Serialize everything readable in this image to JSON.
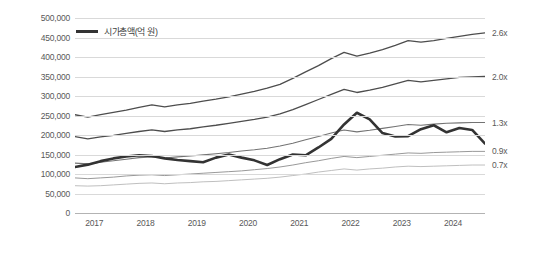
{
  "legend": {
    "label": "시가총액(억 원)",
    "swatch_color": "#333333"
  },
  "axes": {
    "y_ticks": [
      "500,000",
      "450,000",
      "400,000",
      "350,000",
      "300,000",
      "250,000",
      "200,000",
      "150,000",
      "100,000",
      "50,000",
      "0"
    ],
    "y_tick_values": [
      500000,
      450000,
      400000,
      350000,
      300000,
      250000,
      200000,
      150000,
      100000,
      50000,
      0
    ],
    "x_ticks": [
      "2017",
      "2018",
      "2019",
      "2020",
      "2021",
      "2022",
      "2023",
      "2024"
    ],
    "y_min": 0,
    "y_max": 500000,
    "grid": true
  },
  "band_labels": [
    {
      "text": "2.6x",
      "value": 462000
    },
    {
      "text": "2.0x",
      "value": 350000
    },
    {
      "text": "1.3x",
      "value": 232000
    },
    {
      "text": "0.9x",
      "value": 158000
    },
    {
      "text": "0.7x",
      "value": 123000
    }
  ],
  "chart_data": {
    "type": "line",
    "title": "",
    "subtitle": "",
    "xlabel": "",
    "ylabel": "",
    "ylim": [
      0,
      500000
    ],
    "xlim": [
      2016.75,
      2024.75
    ],
    "grid": true,
    "legend_position": "top-left",
    "x": [
      2016.75,
      2017.0,
      2017.25,
      2017.5,
      2017.75,
      2018.0,
      2018.25,
      2018.5,
      2018.75,
      2019.0,
      2019.25,
      2019.5,
      2019.75,
      2020.0,
      2020.25,
      2020.5,
      2020.75,
      2021.0,
      2021.25,
      2021.5,
      2021.75,
      2022.0,
      2022.25,
      2022.5,
      2022.75,
      2023.0,
      2023.25,
      2023.5,
      2023.75,
      2024.0,
      2024.25,
      2024.5,
      2024.75
    ],
    "annotations": [
      "2.6x",
      "2.0x",
      "1.3x",
      "0.9x",
      "0.7x"
    ],
    "series": [
      {
        "name": "시가총액(억 원)",
        "color": "#333333",
        "width": 2.6,
        "values": [
          118000,
          124000,
          133000,
          140000,
          145000,
          148000,
          146000,
          140000,
          136000,
          133000,
          130000,
          142000,
          150000,
          142000,
          135000,
          123000,
          138000,
          150000,
          148000,
          168000,
          190000,
          227000,
          257000,
          240000,
          205000,
          196000,
          197000,
          215000,
          225000,
          207000,
          218000,
          213000,
          178000
        ]
      },
      {
        "name": "2.6x",
        "color": "#4d4d4d",
        "width": 1.3,
        "values": [
          252000,
          246000,
          252000,
          258000,
          264000,
          271000,
          277000,
          272000,
          277000,
          281000,
          287000,
          292000,
          298000,
          305000,
          312000,
          320000,
          330000,
          345000,
          362000,
          378000,
          396000,
          412000,
          402000,
          410000,
          419000,
          430000,
          442000,
          438000,
          442000,
          448000,
          453000,
          458000,
          462000
        ]
      },
      {
        "name": "2.0x",
        "color": "#4d4d4d",
        "width": 1.3,
        "values": [
          196000,
          190000,
          195000,
          199000,
          204000,
          209000,
          213000,
          209000,
          213000,
          216000,
          221000,
          225000,
          230000,
          235000,
          240000,
          246000,
          254000,
          265000,
          278000,
          291000,
          304000,
          317000,
          309000,
          315000,
          322000,
          331000,
          340000,
          336000,
          340000,
          344000,
          348000,
          349000,
          350000
        ]
      },
      {
        "name": "1.3x",
        "color": "#737373",
        "width": 1.1,
        "values": [
          128000,
          126000,
          130000,
          134000,
          138000,
          142000,
          144000,
          141000,
          144000,
          146000,
          149000,
          152000,
          155000,
          159000,
          162000,
          166000,
          172000,
          179000,
          188000,
          196000,
          205000,
          213000,
          208000,
          212000,
          217000,
          222000,
          227000,
          225000,
          228000,
          230000,
          231000,
          232000,
          232000
        ]
      },
      {
        "name": "0.9x",
        "color": "#999999",
        "width": 1.0,
        "values": [
          90000,
          88000,
          90000,
          92000,
          95000,
          97000,
          98000,
          96000,
          98000,
          100000,
          102000,
          104000,
          106000,
          108000,
          111000,
          114000,
          118000,
          123000,
          129000,
          134000,
          140000,
          145000,
          142000,
          145000,
          148000,
          151000,
          154000,
          153000,
          155000,
          156000,
          157000,
          158000,
          158000
        ]
      },
      {
        "name": "0.7x",
        "color": "#bfbfbf",
        "width": 1.0,
        "values": [
          70000,
          69000,
          70000,
          72000,
          74000,
          76000,
          77000,
          75000,
          77000,
          78000,
          80000,
          81000,
          83000,
          85000,
          87000,
          89000,
          92000,
          96000,
          100000,
          105000,
          109000,
          113000,
          110000,
          113000,
          115000,
          118000,
          120000,
          119000,
          120000,
          121000,
          122000,
          123000,
          123000
        ]
      }
    ]
  }
}
